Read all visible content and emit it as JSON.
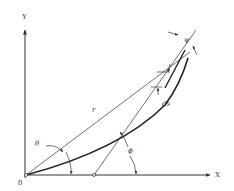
{
  "diagram": {
    "labels": {
      "y_axis": "Y",
      "x_axis": "X",
      "origin": "0",
      "radius": "r",
      "theta": "θ",
      "phi": "ϕ",
      "psi": "ψ",
      "ds": "ds"
    },
    "colors": {
      "line": "#333333",
      "curve": "#222222",
      "background": "#ffffff"
    }
  }
}
